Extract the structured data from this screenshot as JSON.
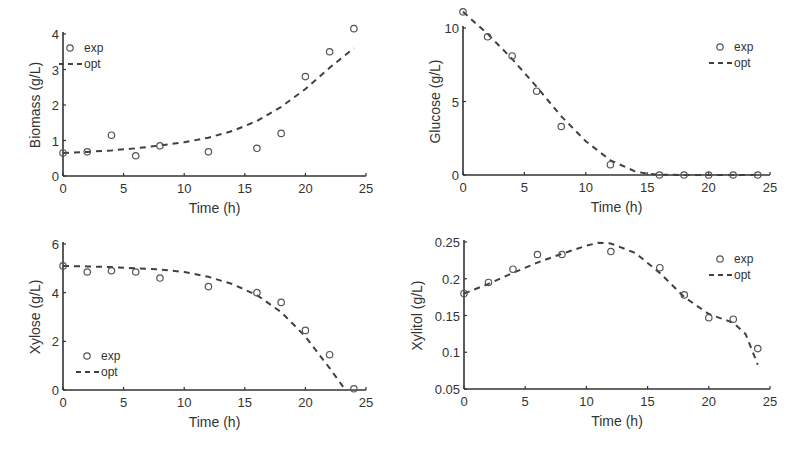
{
  "chart_data": [
    {
      "type": "line",
      "title": "",
      "xlabel": "Time (h)",
      "ylabel": "Biomass (g/L)",
      "xlim": [
        0,
        25
      ],
      "ylim": [
        0,
        4.2
      ],
      "xticks": [
        0,
        5,
        10,
        15,
        20,
        25
      ],
      "yticks": [
        0,
        1,
        2,
        3,
        4
      ],
      "legend_position": "upper-left",
      "series": [
        {
          "name": "exp",
          "style": "markers-circle",
          "x": [
            0,
            2,
            4,
            6,
            8,
            12,
            16,
            18,
            20,
            22,
            24
          ],
          "values": [
            0.65,
            0.68,
            1.15,
            0.57,
            0.85,
            0.68,
            0.78,
            1.2,
            2.8,
            3.5,
            4.15
          ]
        },
        {
          "name": "opt",
          "style": "dashed",
          "x": [
            0,
            2,
            4,
            6,
            8,
            10,
            12,
            14,
            16,
            18,
            20,
            22,
            24
          ],
          "values": [
            0.65,
            0.68,
            0.72,
            0.78,
            0.86,
            0.95,
            1.08,
            1.27,
            1.55,
            1.95,
            2.45,
            3.05,
            3.6
          ]
        }
      ]
    },
    {
      "type": "line",
      "title": "",
      "xlabel": "Time (h)",
      "ylabel": "Glucose (g/L)",
      "xlim": [
        0,
        25
      ],
      "ylim": [
        0,
        11.2
      ],
      "xticks": [
        0,
        5,
        10,
        15,
        20,
        25
      ],
      "yticks": [
        0,
        5,
        10
      ],
      "legend_position": "upper-right",
      "series": [
        {
          "name": "exp",
          "style": "markers-circle",
          "x": [
            0,
            2,
            4,
            6,
            8,
            12,
            16,
            18,
            20,
            22,
            24
          ],
          "values": [
            11.1,
            9.4,
            8.1,
            5.7,
            3.3,
            0.7,
            0.0,
            0.0,
            0.0,
            0.0,
            0.0
          ]
        },
        {
          "name": "opt",
          "style": "dashed",
          "x": [
            0,
            2,
            4,
            6,
            8,
            10,
            12,
            14,
            15,
            16,
            18,
            20,
            22,
            24
          ],
          "values": [
            11.1,
            9.6,
            7.9,
            6.0,
            4.0,
            2.3,
            1.0,
            0.25,
            0.08,
            0.02,
            0.0,
            0.0,
            0.0,
            0.0
          ]
        }
      ]
    },
    {
      "type": "line",
      "title": "",
      "xlabel": "Time (h)",
      "ylabel": "Xylose (g/L)",
      "xlim": [
        0,
        25
      ],
      "ylim": [
        0,
        6
      ],
      "xticks": [
        0,
        5,
        10,
        15,
        20,
        25
      ],
      "yticks": [
        0,
        2,
        4,
        6
      ],
      "legend_position": "lower-left",
      "series": [
        {
          "name": "exp",
          "style": "markers-circle",
          "x": [
            0,
            2,
            4,
            6,
            8,
            12,
            16,
            18,
            20,
            22,
            24
          ],
          "values": [
            5.1,
            4.85,
            4.9,
            4.85,
            4.6,
            4.25,
            4.0,
            3.6,
            2.45,
            1.45,
            0.05
          ]
        },
        {
          "name": "opt",
          "style": "dashed",
          "x": [
            0,
            2,
            4,
            6,
            8,
            10,
            12,
            14,
            16,
            18,
            20,
            22,
            23.3
          ],
          "values": [
            5.1,
            5.08,
            5.05,
            5.0,
            4.95,
            4.85,
            4.65,
            4.35,
            3.9,
            3.2,
            2.2,
            0.9,
            0.0
          ]
        }
      ]
    },
    {
      "type": "line",
      "title": "",
      "xlabel": "Time (h)",
      "ylabel": "Xylitol (g/L)",
      "xlim": [
        0,
        25
      ],
      "ylim": [
        0.05,
        0.25
      ],
      "xticks": [
        0,
        5,
        10,
        15,
        20,
        25
      ],
      "yticks": [
        0.05,
        0.1,
        0.15,
        0.2,
        0.25
      ],
      "legend_position": "upper-right",
      "series": [
        {
          "name": "exp",
          "style": "markers-circle",
          "x": [
            0,
            2,
            4,
            6,
            8,
            12,
            16,
            18,
            20,
            22,
            24
          ],
          "values": [
            0.18,
            0.195,
            0.213,
            0.233,
            0.233,
            0.237,
            0.215,
            0.178,
            0.147,
            0.145,
            0.105
          ]
        },
        {
          "name": "opt",
          "style": "dashed",
          "x": [
            0,
            2,
            4,
            6,
            8,
            10,
            11,
            12,
            14,
            16,
            18,
            20,
            22,
            23,
            24
          ],
          "values": [
            0.18,
            0.193,
            0.208,
            0.222,
            0.234,
            0.245,
            0.249,
            0.248,
            0.235,
            0.208,
            0.175,
            0.152,
            0.14,
            0.125,
            0.083
          ]
        }
      ]
    }
  ],
  "panels": [
    {
      "ylabel": "Biomass (g/L)",
      "xlabel": "Time (h)",
      "legend": {
        "exp": "exp",
        "opt": "opt"
      },
      "yticklabels": [
        "0",
        "1",
        "2",
        "3",
        "4"
      ]
    },
    {
      "ylabel": "Glucose (g/L)",
      "xlabel": "Time (h)",
      "legend": {
        "exp": "exp",
        "opt": "opt"
      },
      "yticklabels": [
        "0",
        "5",
        "10"
      ]
    },
    {
      "ylabel": "Xylose (g/L)",
      "xlabel": "Time (h)",
      "legend": {
        "exp": "exp",
        "opt": "opt"
      },
      "yticklabels": [
        "0",
        "2",
        "4",
        "6"
      ]
    },
    {
      "ylabel": "Xylitol (g/L)",
      "xlabel": "Time (h)",
      "legend": {
        "exp": "exp",
        "opt": "opt"
      },
      "yticklabels": [
        "0.05",
        "0.1",
        "0.15",
        "0.2",
        "0.25"
      ]
    }
  ],
  "xticklabels": [
    "0",
    "5",
    "10",
    "15",
    "20",
    "25"
  ],
  "colors": {
    "line": "#404040",
    "axis": "#333333",
    "text": "#333333"
  }
}
